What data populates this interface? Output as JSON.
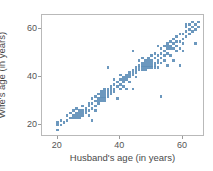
{
  "chart_data": {
    "type": "scatter",
    "title": "",
    "xlabel": "Husband's age (in years)",
    "ylabel": "Wife's age (in years)",
    "xlim": [
      15,
      67
    ],
    "ylim": [
      15,
      66
    ],
    "xticks": [
      20,
      40,
      60
    ],
    "yticks": [
      20,
      40,
      60
    ],
    "grid": false,
    "legend": null,
    "marker": "square",
    "marker_color": "#5f8fb9",
    "series": [
      {
        "name": "couples",
        "points": [
          [
            20,
            20
          ],
          [
            20,
            21
          ],
          [
            20,
            18
          ],
          [
            21,
            20
          ],
          [
            21,
            22
          ],
          [
            22,
            21
          ],
          [
            23,
            22
          ],
          [
            23,
            24
          ],
          [
            24,
            23
          ],
          [
            24,
            25
          ],
          [
            25,
            24
          ],
          [
            25,
            23
          ],
          [
            25,
            26
          ],
          [
            26,
            24
          ],
          [
            26,
            25
          ],
          [
            26,
            23
          ],
          [
            26,
            27
          ],
          [
            27,
            24
          ],
          [
            27,
            25
          ],
          [
            27,
            26
          ],
          [
            27,
            23
          ],
          [
            28,
            25
          ],
          [
            28,
            26
          ],
          [
            28,
            24
          ],
          [
            28,
            28
          ],
          [
            29,
            26
          ],
          [
            29,
            27
          ],
          [
            29,
            25
          ],
          [
            30,
            28
          ],
          [
            30,
            26
          ],
          [
            30,
            29
          ],
          [
            30,
            24
          ],
          [
            31,
            29
          ],
          [
            31,
            27
          ],
          [
            31,
            31
          ],
          [
            31,
            22
          ],
          [
            32,
            30
          ],
          [
            32,
            28
          ],
          [
            32,
            32
          ],
          [
            32,
            26
          ],
          [
            33,
            31
          ],
          [
            33,
            33
          ],
          [
            33,
            30
          ],
          [
            33,
            29
          ],
          [
            34,
            32
          ],
          [
            34,
            33
          ],
          [
            34,
            31
          ],
          [
            34,
            30
          ],
          [
            34,
            34
          ],
          [
            35,
            33
          ],
          [
            35,
            32
          ],
          [
            35,
            34
          ],
          [
            35,
            31
          ],
          [
            35,
            35
          ],
          [
            35,
            30
          ],
          [
            36,
            34
          ],
          [
            36,
            33
          ],
          [
            36,
            35
          ],
          [
            36,
            32
          ],
          [
            36,
            44
          ],
          [
            37,
            35
          ],
          [
            37,
            34
          ],
          [
            37,
            36
          ],
          [
            37,
            33
          ],
          [
            38,
            35
          ],
          [
            38,
            37
          ],
          [
            38,
            34
          ],
          [
            38,
            39
          ],
          [
            39,
            36
          ],
          [
            39,
            38
          ],
          [
            39,
            31
          ],
          [
            40,
            39
          ],
          [
            40,
            37
          ],
          [
            40,
            35
          ],
          [
            40,
            41
          ],
          [
            41,
            38
          ],
          [
            41,
            40
          ],
          [
            41,
            39
          ],
          [
            41,
            36
          ],
          [
            42,
            40
          ],
          [
            42,
            41
          ],
          [
            42,
            39
          ],
          [
            42,
            35
          ],
          [
            43,
            41
          ],
          [
            43,
            40
          ],
          [
            43,
            42
          ],
          [
            43,
            38
          ],
          [
            44,
            42
          ],
          [
            44,
            41
          ],
          [
            44,
            43
          ],
          [
            44,
            51
          ],
          [
            44,
            35
          ],
          [
            45,
            43
          ],
          [
            45,
            42
          ],
          [
            45,
            44
          ],
          [
            45,
            40
          ],
          [
            46,
            44
          ],
          [
            46,
            43
          ],
          [
            46,
            45
          ],
          [
            46,
            47
          ],
          [
            47,
            45
          ],
          [
            47,
            44
          ],
          [
            47,
            46
          ],
          [
            47,
            43
          ],
          [
            47,
            48
          ],
          [
            48,
            46
          ],
          [
            48,
            45
          ],
          [
            48,
            44
          ],
          [
            48,
            47
          ],
          [
            48,
            43
          ],
          [
            49,
            46
          ],
          [
            49,
            45
          ],
          [
            49,
            47
          ],
          [
            49,
            44
          ],
          [
            49,
            48
          ],
          [
            50,
            47
          ],
          [
            50,
            46
          ],
          [
            50,
            45
          ],
          [
            50,
            44
          ],
          [
            50,
            49
          ],
          [
            51,
            48
          ],
          [
            51,
            46
          ],
          [
            51,
            45
          ],
          [
            51,
            50
          ],
          [
            51,
            44
          ],
          [
            52,
            49
          ],
          [
            52,
            47
          ],
          [
            52,
            46
          ],
          [
            52,
            53
          ],
          [
            52,
            44
          ],
          [
            53,
            50
          ],
          [
            53,
            48
          ],
          [
            53,
            46
          ],
          [
            53,
            52
          ],
          [
            53,
            32
          ],
          [
            54,
            51
          ],
          [
            54,
            53
          ],
          [
            54,
            49
          ],
          [
            54,
            47
          ],
          [
            55,
            53
          ],
          [
            55,
            52
          ],
          [
            55,
            50
          ],
          [
            55,
            54
          ],
          [
            55,
            45
          ],
          [
            56,
            53
          ],
          [
            56,
            52
          ],
          [
            56,
            55
          ],
          [
            56,
            49
          ],
          [
            57,
            54
          ],
          [
            57,
            52
          ],
          [
            57,
            56
          ],
          [
            57,
            47
          ],
          [
            58,
            55
          ],
          [
            58,
            53
          ],
          [
            58,
            51
          ],
          [
            58,
            57
          ],
          [
            59,
            55
          ],
          [
            59,
            52
          ],
          [
            59,
            58
          ],
          [
            59,
            45
          ],
          [
            60,
            56
          ],
          [
            60,
            58
          ],
          [
            60,
            54
          ],
          [
            60,
            51
          ],
          [
            61,
            59
          ],
          [
            61,
            57
          ],
          [
            61,
            62
          ],
          [
            61,
            61
          ],
          [
            62,
            60
          ],
          [
            62,
            62
          ],
          [
            62,
            58
          ],
          [
            63,
            61
          ],
          [
            63,
            63
          ],
          [
            63,
            59
          ],
          [
            64,
            62
          ],
          [
            64,
            60
          ],
          [
            64,
            54
          ],
          [
            65,
            61
          ],
          [
            65,
            63
          ]
        ]
      }
    ]
  },
  "axes": {
    "xtick_labels": [
      "20",
      "40",
      "60"
    ],
    "ytick_labels": [
      "20",
      "40",
      "60"
    ]
  }
}
